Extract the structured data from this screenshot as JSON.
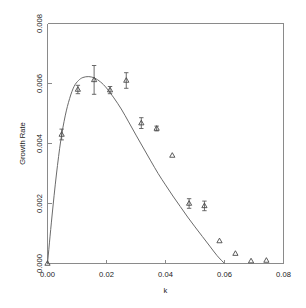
{
  "chart_data": {
    "type": "scatter",
    "title": "",
    "xlabel": "k",
    "ylabel": "Growth Rate",
    "xlim": [
      0.0,
      0.08
    ],
    "ylim": [
      0.0,
      0.008
    ],
    "xticks": [
      0.0,
      0.02,
      0.04,
      0.06,
      0.08
    ],
    "xtick_labels": [
      "0.00",
      "0.02",
      "0.04",
      "0.06",
      "0.08"
    ],
    "yticks": [
      0.0,
      0.002,
      0.004,
      0.006,
      0.008
    ],
    "ytick_labels": [
      "0.000",
      "0.002",
      "0.004",
      "0.006",
      "0.008"
    ],
    "grid": false,
    "legend": null,
    "marker": "triangle-up",
    "marker_color": "#4a4a4a",
    "curve_color": "#6b6b6b",
    "axis_color": "#8a8a8a",
    "series": [
      {
        "name": "measured growth rate",
        "type": "scatter",
        "marker": "triangle-up",
        "has_error_bars": true,
        "points": [
          {
            "x": 0.0,
            "y": 0.0,
            "yerr": 0.0
          },
          {
            "x": 0.0048,
            "y": 0.0043,
            "yerr": 0.00018
          },
          {
            "x": 0.0103,
            "y": 0.0058,
            "yerr": 0.00014
          },
          {
            "x": 0.0158,
            "y": 0.00612,
            "yerr": 0.00048
          },
          {
            "x": 0.0212,
            "y": 0.00578,
            "yerr": 0.00012
          },
          {
            "x": 0.0267,
            "y": 0.0061,
            "yerr": 0.00026
          },
          {
            "x": 0.0318,
            "y": 0.00468,
            "yerr": 0.00018
          },
          {
            "x": 0.037,
            "y": 0.0045,
            "yerr": 8e-05
          },
          {
            "x": 0.0423,
            "y": 0.0036,
            "yerr": 0.0
          },
          {
            "x": 0.048,
            "y": 0.002,
            "yerr": 0.00016
          },
          {
            "x": 0.0532,
            "y": 0.00192,
            "yerr": 0.00016
          },
          {
            "x": 0.0583,
            "y": 0.00075,
            "yerr": 0.0
          },
          {
            "x": 0.0637,
            "y": 0.00033,
            "yerr": 0.0
          },
          {
            "x": 0.069,
            "y": 8e-05,
            "yerr": 0.0
          },
          {
            "x": 0.0742,
            "y": 0.0001,
            "yerr": 0.0
          }
        ]
      },
      {
        "name": "theoretical fit",
        "type": "line",
        "points": [
          {
            "x": 0.0,
            "y": 0.0
          },
          {
            "x": 0.0015,
            "y": 0.00155
          },
          {
            "x": 0.003,
            "y": 0.00295
          },
          {
            "x": 0.0045,
            "y": 0.0041
          },
          {
            "x": 0.006,
            "y": 0.00492
          },
          {
            "x": 0.0075,
            "y": 0.0055
          },
          {
            "x": 0.009,
            "y": 0.0059
          },
          {
            "x": 0.0105,
            "y": 0.0061
          },
          {
            "x": 0.012,
            "y": 0.0062
          },
          {
            "x": 0.014,
            "y": 0.00623
          },
          {
            "x": 0.016,
            "y": 0.00618
          },
          {
            "x": 0.018,
            "y": 0.00605
          },
          {
            "x": 0.02,
            "y": 0.00585
          },
          {
            "x": 0.0225,
            "y": 0.00552
          },
          {
            "x": 0.025,
            "y": 0.00515
          },
          {
            "x": 0.0275,
            "y": 0.00472
          },
          {
            "x": 0.03,
            "y": 0.00428
          },
          {
            "x": 0.0325,
            "y": 0.00385
          },
          {
            "x": 0.035,
            "y": 0.00342
          },
          {
            "x": 0.0375,
            "y": 0.003
          },
          {
            "x": 0.04,
            "y": 0.00262
          },
          {
            "x": 0.0425,
            "y": 0.00225
          },
          {
            "x": 0.045,
            "y": 0.0019
          },
          {
            "x": 0.0475,
            "y": 0.00155
          },
          {
            "x": 0.05,
            "y": 0.00122
          },
          {
            "x": 0.0525,
            "y": 0.0009
          },
          {
            "x": 0.055,
            "y": 0.00058
          },
          {
            "x": 0.0575,
            "y": 0.00026
          },
          {
            "x": 0.06,
            "y": 0.0
          }
        ]
      }
    ]
  }
}
